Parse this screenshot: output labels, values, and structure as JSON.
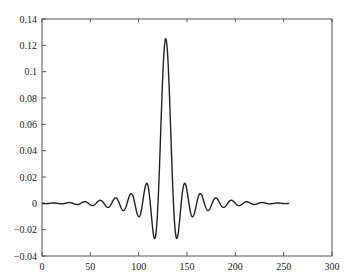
{
  "chart_data": {
    "type": "line",
    "title": "",
    "xlabel": "",
    "ylabel": "",
    "xlim": [
      0,
      300
    ],
    "ylim": [
      -0.04,
      0.14
    ],
    "grid": false,
    "legend": null,
    "x_ticks": [
      "0",
      "50",
      "100",
      "150",
      "200",
      "250",
      "300"
    ],
    "y_ticks": [
      "-0.04",
      "-0.02",
      "0",
      "0.02",
      "0.04",
      "0.06",
      "0.08",
      "0.1",
      "0.12",
      "0.14"
    ],
    "series": [
      {
        "name": "impulse response",
        "color": "#222222",
        "description": "windowed sinc, 256 samples, centered at n=128, peak ~0.125, first sidelobes ~ -0.027",
        "center": 128,
        "length": 256,
        "peak": 0.125,
        "key_points": [
          {
            "x": 0,
            "y": 0.0
          },
          {
            "x": 30,
            "y": 0.002
          },
          {
            "x": 60,
            "y": 0.004
          },
          {
            "x": 77,
            "y": 0.006
          },
          {
            "x": 93,
            "y": 0.009
          },
          {
            "x": 100,
            "y": -0.011
          },
          {
            "x": 109,
            "y": 0.015
          },
          {
            "x": 116,
            "y": -0.027
          },
          {
            "x": 128,
            "y": 0.125
          },
          {
            "x": 140,
            "y": -0.027
          },
          {
            "x": 147,
            "y": 0.015
          },
          {
            "x": 156,
            "y": -0.011
          },
          {
            "x": 163,
            "y": 0.009
          },
          {
            "x": 179,
            "y": 0.006
          },
          {
            "x": 196,
            "y": 0.004
          },
          {
            "x": 226,
            "y": 0.002
          },
          {
            "x": 255,
            "y": 0.0
          }
        ]
      }
    ]
  }
}
